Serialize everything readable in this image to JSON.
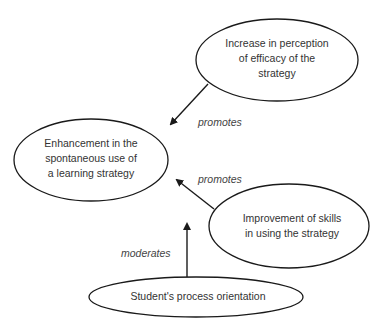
{
  "diagram": {
    "nodes": [
      {
        "id": "enhancement",
        "lines": [
          "Enhancement in the",
          "spontaneous use of",
          "a learning strategy"
        ]
      },
      {
        "id": "efficacy",
        "lines": [
          "Increase in perception",
          "of efficacy of the",
          "strategy"
        ]
      },
      {
        "id": "skills",
        "lines": [
          "Improvement of skills",
          "in using the strategy"
        ]
      },
      {
        "id": "orientation",
        "lines": [
          "Student's process orientation"
        ]
      }
    ],
    "edges": [
      {
        "from": "efficacy",
        "to": "enhancement",
        "label": "promotes"
      },
      {
        "from": "skills",
        "to": "enhancement",
        "label": "promotes"
      },
      {
        "from": "orientation",
        "to": "enhancement",
        "label": "moderates"
      }
    ],
    "colors": {
      "stroke": "#1a1a1a",
      "text": "#333333",
      "background": "#ffffff"
    }
  }
}
